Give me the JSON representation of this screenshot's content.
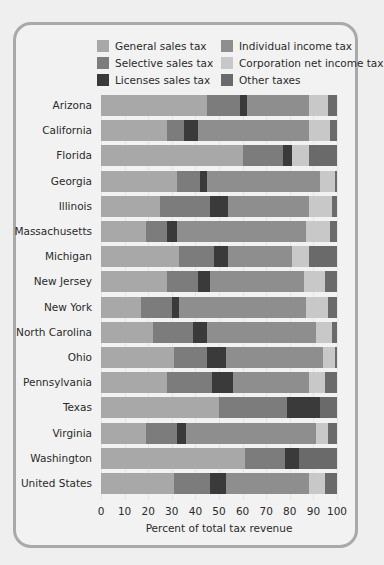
{
  "chart_data": {
    "type": "bar",
    "orientation": "horizontal",
    "stacked": true,
    "title": "",
    "xlabel": "Percent of total tax revenue",
    "ylabel": "",
    "xlim": [
      0,
      100
    ],
    "xticks": [
      0,
      10,
      20,
      30,
      40,
      50,
      60,
      70,
      80,
      90,
      100
    ],
    "grid": true,
    "legend_position": "top",
    "categories": [
      "Arizona",
      "California",
      "Florida",
      "Georgia",
      "Illinois",
      "Massachusetts",
      "Michigan",
      "New Jersey",
      "New York",
      "North Carolina",
      "Ohio",
      "Pennsylvania",
      "Texas",
      "Virginia",
      "Washington",
      "United States"
    ],
    "series": [
      {
        "name": "General sales tax",
        "color": "#a8a8a8",
        "values": [
          45,
          28,
          60,
          32,
          25,
          19,
          33,
          28,
          17,
          22,
          31,
          28,
          50,
          19,
          61,
          31
        ]
      },
      {
        "name": "Selective sales tax",
        "color": "#7c7c7c",
        "values": [
          14,
          7,
          17,
          10,
          21,
          9,
          15,
          13,
          13,
          17,
          14,
          19,
          29,
          13,
          17,
          15
        ]
      },
      {
        "name": "Licenses sales tax",
        "color": "#3a3a3a",
        "values": [
          3,
          6,
          4,
          3,
          8,
          4,
          6,
          5,
          3,
          6,
          8,
          9,
          14,
          4,
          6,
          7
        ]
      },
      {
        "name": "Individual income tax",
        "color": "#8e8e8e",
        "values": [
          26,
          47,
          0,
          48,
          34,
          55,
          27,
          40,
          54,
          46,
          41,
          32,
          0,
          55,
          0,
          35
        ]
      },
      {
        "name": "Corporation net income tax",
        "color": "#c8c8c8",
        "values": [
          8,
          9,
          7,
          6,
          10,
          10,
          7,
          9,
          9,
          7,
          5,
          7,
          0,
          5,
          0,
          7
        ]
      },
      {
        "name": "Other taxes",
        "color": "#6a6a6a",
        "values": [
          4,
          3,
          12,
          1,
          2,
          3,
          12,
          5,
          4,
          2,
          1,
          5,
          7,
          4,
          16,
          5
        ]
      }
    ]
  },
  "legend": [
    {
      "label": "General sales tax",
      "color": "#a8a8a8"
    },
    {
      "label": "Selective sales tax",
      "color": "#7c7c7c"
    },
    {
      "label": "Licenses sales tax",
      "color": "#3a3a3a"
    },
    {
      "label": "Individual income tax",
      "color": "#8e8e8e"
    },
    {
      "label": "Corporation net income tax",
      "color": "#c8c8c8"
    },
    {
      "label": "Other taxes",
      "color": "#6a6a6a"
    }
  ],
  "axis": {
    "xlabel": "Percent of total tax revenue",
    "ticks": [
      "0",
      "10",
      "20",
      "30",
      "40",
      "50",
      "60",
      "70",
      "80",
      "90",
      "100"
    ]
  }
}
